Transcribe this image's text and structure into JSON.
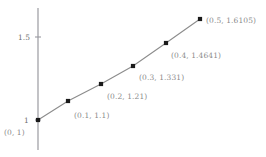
{
  "chart_data": {
    "type": "scatter",
    "title": "",
    "xlabel": "",
    "ylabel": "",
    "grid": false,
    "legend": null,
    "xlim": [
      0,
      0.56
    ],
    "ylim": [
      0.92,
      1.68
    ],
    "axis_color": "#9a9aa0",
    "line_color": "#8c8c8c",
    "marker_color": "#1a1a1a",
    "label_color": "#8a8a8a",
    "x": [
      0,
      0.1,
      0.2,
      0.3,
      0.4,
      0.5
    ],
    "y": [
      1,
      1.1,
      1.21,
      1.331,
      1.4641,
      1.6105
    ],
    "point_labels": [
      "(0, 1)",
      "(0.1, 1.1)",
      "(0.2, 1.21)",
      "(0.3, 1.331)",
      "(0.4, 1.4641)",
      "(0.5, 1.6105)"
    ],
    "yticks": [
      1,
      1.5
    ],
    "ytick_labels": [
      "1",
      "1.5"
    ],
    "xticks": [],
    "xtick_labels": []
  },
  "markers": [
    {
      "name": "data-point-0",
      "cx": 38,
      "cy": 120,
      "label": "(0, 1)",
      "lx": 4,
      "ly": 129
    },
    {
      "name": "data-point-1",
      "cx": 68,
      "cy": 101,
      "label": "(0.1, 1.1)",
      "lx": 74,
      "ly": 112
    },
    {
      "name": "data-point-2",
      "cx": 101,
      "cy": 84,
      "label": "(0.2, 1.21)",
      "lx": 107,
      "ly": 93
    },
    {
      "name": "data-point-3",
      "cx": 133,
      "cy": 66,
      "label": "(0.3, 1.331)",
      "lx": 139,
      "ly": 74
    },
    {
      "name": "data-point-4",
      "cx": 166,
      "cy": 43,
      "label": "(0.4, 1.4641)",
      "lx": 171,
      "ly": 52
    },
    {
      "name": "data-point-5",
      "cx": 200,
      "cy": 19,
      "label": "(0.5, 1.6105)",
      "lx": 206,
      "ly": 17
    }
  ],
  "axis": {
    "x_pos": 38,
    "y_top": 8,
    "y_bottom": 150,
    "ticks": [
      {
        "name": "ytick-1",
        "label": "1",
        "y": 120,
        "lx": 24,
        "ly": 117
      },
      {
        "name": "ytick-1-5",
        "label": "1.5",
        "y": 37,
        "lx": 18,
        "ly": 34
      }
    ]
  }
}
